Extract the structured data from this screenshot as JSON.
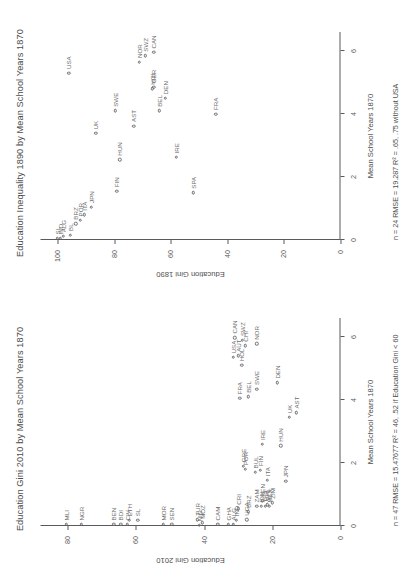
{
  "chart_data": [
    {
      "id": "top",
      "type": "scatter",
      "title": "Education Gini 2010 by Mean School Years 1870",
      "xlabel": "Mean School Years 1870",
      "ylabel": "Education Gini 2010",
      "xlim": [
        0,
        6.6
      ],
      "ylim": [
        0,
        88
      ],
      "xticks": [
        0,
        2,
        4,
        6
      ],
      "yticks": [
        0,
        20,
        40,
        60,
        80
      ],
      "grid": false,
      "legend": null,
      "annotation": "n = 47    RMSE = 15.47677   R² = 46, .52 if Education Gini < 60",
      "points": [
        {
          "label": "MLI",
          "x": 0.05,
          "y": 80.5
        },
        {
          "label": "NGR",
          "x": 0.05,
          "y": 76.0
        },
        {
          "label": "BEN",
          "x": 0.05,
          "y": 66.5
        },
        {
          "label": "BDI",
          "x": 0.05,
          "y": 64.5
        },
        {
          "label": "CIV",
          "x": 0.05,
          "y": 62.5
        },
        {
          "label": "ETH",
          "x": 0.18,
          "y": 62.0
        },
        {
          "label": "SL",
          "x": 0.18,
          "y": 59.5
        },
        {
          "label": "MOR",
          "x": 0.05,
          "y": 52.0
        },
        {
          "label": "SEN",
          "x": 0.05,
          "y": 49.5
        },
        {
          "label": "NIG",
          "x": 0.02,
          "y": 41.5
        },
        {
          "label": "MOZ",
          "x": 0.1,
          "y": 40.5
        },
        {
          "label": "TUR",
          "x": 0.2,
          "y": 42.0
        },
        {
          "label": "CAM",
          "x": 0.05,
          "y": 36.0
        },
        {
          "label": "GHA",
          "x": 0.05,
          "y": 33.0
        },
        {
          "label": "ALG",
          "x": 0.05,
          "y": 31.5
        },
        {
          "label": "IND",
          "x": 0.18,
          "y": 30.5
        },
        {
          "label": "CRI",
          "x": 0.55,
          "y": 30.0
        },
        {
          "label": "UGA",
          "x": 0.2,
          "y": 27.5
        },
        {
          "label": "BRZ",
          "x": 0.45,
          "y": 27.0
        },
        {
          "label": "KEN",
          "x": 0.8,
          "y": 23.0
        },
        {
          "label": "ZAM",
          "x": 0.62,
          "y": 24.5
        },
        {
          "label": "IDN",
          "x": 0.62,
          "y": 23.2
        },
        {
          "label": "THA",
          "x": 0.62,
          "y": 22.0
        },
        {
          "label": "PHL",
          "x": 0.68,
          "y": 21.5
        },
        {
          "label": "MEX",
          "x": 0.62,
          "y": 20.8
        },
        {
          "label": "ZIM",
          "x": 0.74,
          "y": 20.0
        },
        {
          "label": "ITA",
          "x": 1.45,
          "y": 21.5
        },
        {
          "label": "BUL",
          "x": 1.7,
          "y": 25.0
        },
        {
          "label": "POR",
          "x": 1.8,
          "y": 28.0
        },
        {
          "label": "GRE",
          "x": 1.9,
          "y": 28.5
        },
        {
          "label": "FIN",
          "x": 1.78,
          "y": 23.5
        },
        {
          "label": "JPN",
          "x": 1.42,
          "y": 16.0
        },
        {
          "label": "HUN",
          "x": 2.55,
          "y": 17.5
        },
        {
          "label": "IRE",
          "x": 2.6,
          "y": 23.0
        },
        {
          "label": "AST",
          "x": 3.6,
          "y": 13.0
        },
        {
          "label": "UK",
          "x": 3.45,
          "y": 15.0
        },
        {
          "label": "FRA",
          "x": 4.05,
          "y": 29.5
        },
        {
          "label": "BEL",
          "x": 4.1,
          "y": 27.0
        },
        {
          "label": "SWE",
          "x": 4.35,
          "y": 24.5
        },
        {
          "label": "DEN",
          "x": 4.55,
          "y": 18.5
        },
        {
          "label": "HOL",
          "x": 5.1,
          "y": 29.0
        },
        {
          "label": "USA",
          "x": 5.35,
          "y": 31.5
        },
        {
          "label": "AUT",
          "x": 5.4,
          "y": 30.0
        },
        {
          "label": "CHI",
          "x": 5.72,
          "y": 28.0
        },
        {
          "label": "SWZ",
          "x": 5.9,
          "y": 28.8
        },
        {
          "label": "NOR",
          "x": 5.78,
          "y": 24.5
        },
        {
          "label": "CAN",
          "x": 5.98,
          "y": 31.0
        }
      ]
    },
    {
      "id": "bottom",
      "type": "scatter",
      "title": "Education Inequality 1890 by Mean School Years 1870",
      "xlabel": "Mean School Years 1870",
      "ylabel": "Education Gini 1890",
      "xlim": [
        0,
        6.6
      ],
      "ylim": [
        0,
        106
      ],
      "xticks": [
        0,
        2,
        4,
        6
      ],
      "yticks": [
        0,
        20,
        40,
        60,
        80,
        100
      ],
      "grid": false,
      "legend": null,
      "annotation": "n = 24    RMSE = 19.287   R² = .65, .75 without USA",
      "points": [
        {
          "label": "SL",
          "x": 0.05,
          "y": 100.0
        },
        {
          "label": "ALG",
          "x": 0.12,
          "y": 98.0
        },
        {
          "label": "IND",
          "x": 0.05,
          "y": 99.0
        },
        {
          "label": "BL",
          "x": 0.16,
          "y": 95.5
        },
        {
          "label": "BRZ",
          "x": 0.52,
          "y": 93.5
        },
        {
          "label": "POR",
          "x": 0.62,
          "y": 92.0
        },
        {
          "label": "ITA",
          "x": 0.8,
          "y": 90.5
        },
        {
          "label": "JPN",
          "x": 1.05,
          "y": 88.0
        },
        {
          "label": "FIN",
          "x": 1.55,
          "y": 79.0
        },
        {
          "label": "SPA",
          "x": 1.5,
          "y": 52.0
        },
        {
          "label": "HUN",
          "x": 2.55,
          "y": 78.0
        },
        {
          "label": "IRE",
          "x": 2.62,
          "y": 58.0
        },
        {
          "label": "UK",
          "x": 3.38,
          "y": 86.5
        },
        {
          "label": "AST",
          "x": 3.62,
          "y": 73.0
        },
        {
          "label": "SWE",
          "x": 4.1,
          "y": 79.5
        },
        {
          "label": "BEL",
          "x": 4.1,
          "y": 64.0
        },
        {
          "label": "FRA",
          "x": 4.0,
          "y": 44.0
        },
        {
          "label": "HOL",
          "x": 4.8,
          "y": 66.5
        },
        {
          "label": "USA",
          "x": 5.3,
          "y": 96.0
        },
        {
          "label": "NOR",
          "x": 5.65,
          "y": 71.0
        },
        {
          "label": "SWZ",
          "x": 5.85,
          "y": 69.0
        },
        {
          "label": "CAN",
          "x": 5.95,
          "y": 66.0
        },
        {
          "label": "GER",
          "x": 4.85,
          "y": 66.0
        },
        {
          "label": "DEN",
          "x": 4.5,
          "y": 62.0
        }
      ]
    }
  ]
}
